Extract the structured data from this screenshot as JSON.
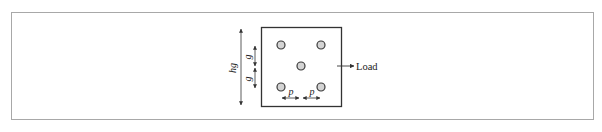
{
  "figure": {
    "type": "bolted-plate-schematic",
    "plate": {
      "bolt_count": 5,
      "bolt_pattern": "staggered (X pattern, 2-1-2)"
    },
    "labels": {
      "height_dim": "hg",
      "gauge_upper": "g",
      "gauge_lower": "g",
      "pitch_left": "p",
      "pitch_right": "p",
      "load": "Load"
    },
    "colors": {
      "frame_border": "#a8a8a8",
      "plate_border": "#333333",
      "bolt_fill": "#d4d4d4",
      "bolt_stroke": "#3a3a3a",
      "line": "#333333"
    }
  }
}
